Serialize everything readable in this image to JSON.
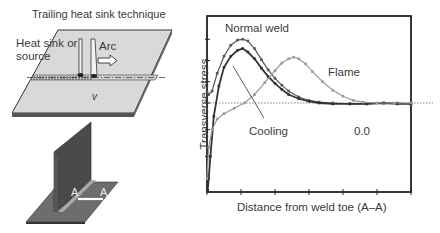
{
  "left_panel": {
    "title": "Trailing heat sink technique",
    "heat_sink_label_line1": "Heat sink or",
    "heat_sink_label_line2": "source",
    "arc_label": "Arc",
    "velocity_label": "v",
    "section_label_left": "A",
    "section_label_right": "A"
  },
  "chart_data": {
    "type": "line",
    "title": "",
    "xlabel": "Distance from weld toe (A–A)",
    "ylabel": "Transverse stress",
    "xlim": [
      0,
      6
    ],
    "ylim": [
      -1,
      1
    ],
    "x_ticks": 7,
    "zero_label": "0.0",
    "grid": false,
    "baseline": "dotted line at stress = 0",
    "annotations": [
      {
        "text": "Normal weld",
        "target_series": "Normal weld"
      },
      {
        "text": "Flame",
        "target_series": "Flame"
      },
      {
        "text": "Cooling",
        "target_series": "Cooling",
        "arrow": true
      }
    ],
    "series": [
      {
        "name": "Normal weld",
        "color": "#555555",
        "x": [
          0.0,
          0.05,
          0.15,
          0.3,
          0.5,
          0.7,
          0.9,
          1.05,
          1.2,
          1.4,
          1.6,
          1.8,
          2.0,
          2.2,
          2.4,
          2.7,
          3.0,
          3.3,
          3.7,
          4.2,
          4.7,
          5.2,
          5.6,
          6.0
        ],
        "y": [
          0.13,
          0.1,
          0.14,
          0.35,
          0.55,
          0.68,
          0.74,
          0.75,
          0.73,
          0.64,
          0.51,
          0.39,
          0.29,
          0.21,
          0.14,
          0.07,
          0.03,
          0.01,
          0.0,
          -0.01,
          -0.01,
          0.0,
          0.0,
          -0.01
        ]
      },
      {
        "name": "Cooling",
        "color": "#333333",
        "x": [
          0.02,
          0.05,
          0.1,
          0.2,
          0.35,
          0.5,
          0.7,
          0.9,
          1.05,
          1.2,
          1.4,
          1.6,
          1.8,
          2.0,
          2.2,
          2.4,
          2.7,
          3.0,
          3.3,
          3.7,
          4.2,
          4.7,
          5.2,
          5.6,
          6.0
        ],
        "y": [
          -0.98,
          -0.85,
          -0.6,
          -0.15,
          0.2,
          0.42,
          0.55,
          0.62,
          0.64,
          0.6,
          0.52,
          0.41,
          0.31,
          0.23,
          0.16,
          0.1,
          0.05,
          0.02,
          0.0,
          -0.01,
          -0.01,
          -0.01,
          0.0,
          -0.01,
          -0.01
        ]
      },
      {
        "name": "Flame",
        "color": "#9a9a9a",
        "x": [
          0.0,
          0.05,
          0.15,
          0.3,
          0.5,
          0.8,
          1.1,
          1.4,
          1.7,
          2.0,
          2.2,
          2.4,
          2.55,
          2.7,
          2.9,
          3.1,
          3.4,
          3.7,
          4.0,
          4.3,
          4.6,
          5.0,
          5.5,
          6.0
        ],
        "y": [
          -0.85,
          -0.5,
          -0.3,
          -0.18,
          -0.12,
          -0.06,
          0.0,
          0.1,
          0.24,
          0.38,
          0.47,
          0.52,
          0.54,
          0.52,
          0.46,
          0.37,
          0.25,
          0.15,
          0.08,
          0.03,
          0.01,
          0.0,
          0.0,
          0.0
        ]
      }
    ]
  }
}
